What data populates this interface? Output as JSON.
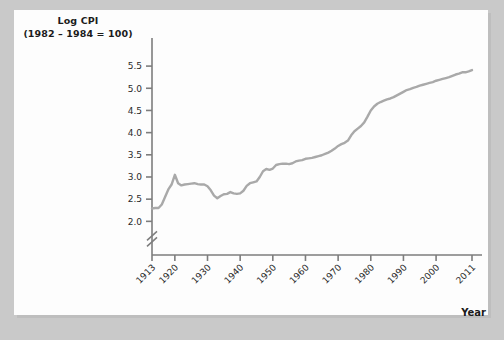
{
  "figure": {
    "background_color": "#c9c9c9",
    "card_color": "#fdfdfd",
    "axis_color": "#7d7d7d",
    "line_color": "#a9a9a9",
    "text_color": "#1b1b1b"
  },
  "axis_title": {
    "line1": "Log CPI",
    "line2": "(1982 – 1984 = 100)"
  },
  "xaxis_label": "Year",
  "chart_data": {
    "type": "line",
    "title": "Log CPI",
    "subtitle": "(1982 – 1984 = 100)",
    "xlabel": "Year",
    "ylabel": "Log CPI (1982 – 1984 = 100)",
    "xlim": [
      1913,
      2011
    ],
    "ylim": [
      1.85,
      5.75
    ],
    "yaxis_break": true,
    "yaxis_break_below": 2.0,
    "grid": false,
    "legend": null,
    "ytick_labels": [
      "2.0",
      "2.5",
      "3.0",
      "3.5",
      "4.0",
      "4.5",
      "5.0",
      "5.5"
    ],
    "ytick_values": [
      2.0,
      2.5,
      3.0,
      3.5,
      4.0,
      4.5,
      5.0,
      5.5
    ],
    "xtick_labels": [
      "1913",
      "1920",
      "1930",
      "1940",
      "1950",
      "1960",
      "1970",
      "1980",
      "1990",
      "2000",
      "2011"
    ],
    "xtick_values": [
      1913,
      1920,
      1930,
      1940,
      1950,
      1960,
      1970,
      1980,
      1990,
      2000,
      2011
    ],
    "series": [
      {
        "name": "Log CPI",
        "color": "#a9a9a9",
        "x": [
          1913,
          1914,
          1915,
          1916,
          1917,
          1918,
          1919,
          1920,
          1921,
          1922,
          1923,
          1924,
          1925,
          1926,
          1927,
          1928,
          1929,
          1930,
          1931,
          1932,
          1933,
          1934,
          1935,
          1936,
          1937,
          1938,
          1939,
          1940,
          1941,
          1942,
          1943,
          1944,
          1945,
          1946,
          1947,
          1948,
          1949,
          1950,
          1951,
          1952,
          1953,
          1954,
          1955,
          1956,
          1957,
          1958,
          1959,
          1960,
          1961,
          1962,
          1963,
          1964,
          1965,
          1966,
          1967,
          1968,
          1969,
          1970,
          1971,
          1972,
          1973,
          1974,
          1975,
          1976,
          1977,
          1978,
          1979,
          1980,
          1981,
          1982,
          1983,
          1984,
          1985,
          1986,
          1987,
          1988,
          1989,
          1990,
          1991,
          1992,
          1993,
          1994,
          1995,
          1996,
          1997,
          1998,
          1999,
          2000,
          2001,
          2002,
          2003,
          2004,
          2005,
          2006,
          2007,
          2008,
          2009,
          2010,
          2011
        ],
        "y": [
          2.29,
          2.3,
          2.3,
          2.38,
          2.55,
          2.72,
          2.83,
          3.05,
          2.86,
          2.81,
          2.83,
          2.84,
          2.85,
          2.86,
          2.84,
          2.83,
          2.83,
          2.79,
          2.7,
          2.58,
          2.52,
          2.57,
          2.61,
          2.62,
          2.66,
          2.63,
          2.62,
          2.63,
          2.69,
          2.8,
          2.86,
          2.88,
          2.9,
          3.0,
          3.13,
          3.18,
          3.16,
          3.19,
          3.27,
          3.29,
          3.3,
          3.3,
          3.29,
          3.31,
          3.35,
          3.37,
          3.38,
          3.41,
          3.42,
          3.43,
          3.45,
          3.47,
          3.49,
          3.52,
          3.55,
          3.59,
          3.64,
          3.7,
          3.74,
          3.77,
          3.82,
          3.94,
          4.03,
          4.09,
          4.15,
          4.23,
          4.36,
          4.5,
          4.59,
          4.65,
          4.69,
          4.72,
          4.75,
          4.77,
          4.8,
          4.84,
          4.88,
          4.92,
          4.96,
          4.98,
          5.01,
          5.03,
          5.06,
          5.08,
          5.1,
          5.12,
          5.14,
          5.17,
          5.19,
          5.21,
          5.23,
          5.25,
          5.28,
          5.31,
          5.33,
          5.36,
          5.36,
          5.38,
          5.41
        ]
      }
    ]
  }
}
